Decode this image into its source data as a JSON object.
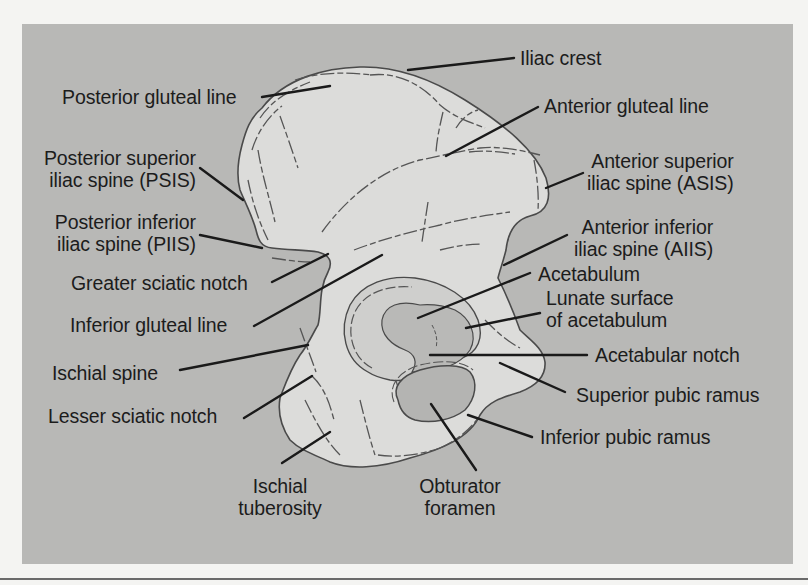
{
  "figure": {
    "colors": {
      "page_background": "#f4f4f2",
      "panel_background": "#b8b8b6",
      "bone_fill": "#dcdcda",
      "bone_outline": "#4a4a4a",
      "fossa_fill": "#b4b4b2",
      "leader_line": "#1a1a1a",
      "label_text": "#1c1c1c"
    }
  },
  "labels": {
    "iliac_crest": "Iliac crest",
    "posterior_gluteal_line": "Posterior gluteal line",
    "anterior_gluteal_line": "Anterior gluteal line",
    "psis_line1": "Posterior superior",
    "psis_line2": "iliac spine (PSIS)",
    "asis_line1": "Anterior superior",
    "asis_line2": "iliac spine (ASIS)",
    "piis_line1": "Posterior inferior",
    "piis_line2": "iliac spine (PIIS)",
    "aiis_line1": "Anterior inferior",
    "aiis_line2": "iliac spine (AIIS)",
    "greater_sciatic_notch": "Greater sciatic notch",
    "acetabulum": "Acetabulum",
    "lunate_line1": "Lunate surface",
    "lunate_line2": "of acetabulum",
    "inferior_gluteal_line": "Inferior gluteal line",
    "acetabular_notch": "Acetabular notch",
    "ischial_spine": "Ischial spine",
    "superior_pubic_ramus": "Superior pubic ramus",
    "lesser_sciatic_notch": "Lesser sciatic notch",
    "inferior_pubic_ramus": "Inferior pubic ramus",
    "ischial_tuberosity_line1": "Ischial",
    "ischial_tuberosity_line2": "tuberosity",
    "obturator_foramen_line1": "Obturator",
    "obturator_foramen_line2": "foramen"
  }
}
